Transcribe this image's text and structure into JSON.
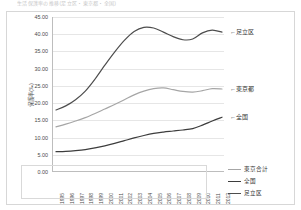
{
  "title_strip": "生活保護率の推移(足立区・東京都・全国)",
  "chart_data": {
    "type": "line",
    "title": "生活保護率の推移(足立区・東京都・全国)",
    "xlabel": "",
    "ylabel": "保護率(‰)",
    "ylim": [
      0,
      45
    ],
    "ytick_step": 5,
    "yticks": [
      "45.00",
      "40.00",
      "35.00",
      "30.00",
      "25.00",
      "20.00",
      "15.00",
      "10.00",
      "5.00",
      "0.00"
    ],
    "grid": true,
    "legend_position": "bottom-right",
    "x": [
      "1995",
      "1996",
      "1997",
      "1998",
      "1999",
      "2000",
      "2001",
      "2002",
      "2003",
      "2004",
      "2005",
      "2006",
      "2007",
      "2008",
      "2009",
      "2010",
      "2011",
      "2012"
    ],
    "series": [
      {
        "name": "足立区",
        "color": "#4d4d4d",
        "values": [
          18.0,
          19.2,
          21.0,
          23.5,
          27.0,
          31.0,
          34.8,
          38.2,
          40.8,
          42.0,
          41.8,
          40.6,
          39.3,
          38.4,
          38.6,
          40.4,
          41.2,
          40.6
        ]
      },
      {
        "name": "東京都",
        "color": "#a6a6a6",
        "values": [
          13.1,
          13.9,
          14.8,
          15.8,
          17.0,
          18.3,
          19.6,
          21.0,
          22.4,
          23.5,
          24.2,
          24.4,
          23.9,
          23.4,
          23.2,
          23.6,
          24.2,
          24.1
        ]
      },
      {
        "name": "全国",
        "color": "#3d3d3d",
        "values": [
          5.9,
          6.0,
          6.2,
          6.5,
          7.0,
          7.6,
          8.3,
          9.1,
          9.9,
          10.6,
          11.2,
          11.6,
          11.9,
          12.2,
          12.6,
          13.6,
          14.8,
          15.9
        ]
      }
    ],
    "annotations": [
      {
        "text": "←足立区",
        "series": "足立区"
      },
      {
        "text": "←東京都",
        "series": "東京都"
      },
      {
        "text": "←全国",
        "series": "全国"
      }
    ],
    "legend": [
      {
        "label": "東京合計",
        "color": "#a6a6a6"
      },
      {
        "label": "全国",
        "color": "#3d3d3d"
      },
      {
        "label": "足立区",
        "color": "#4d4d4d"
      }
    ]
  }
}
